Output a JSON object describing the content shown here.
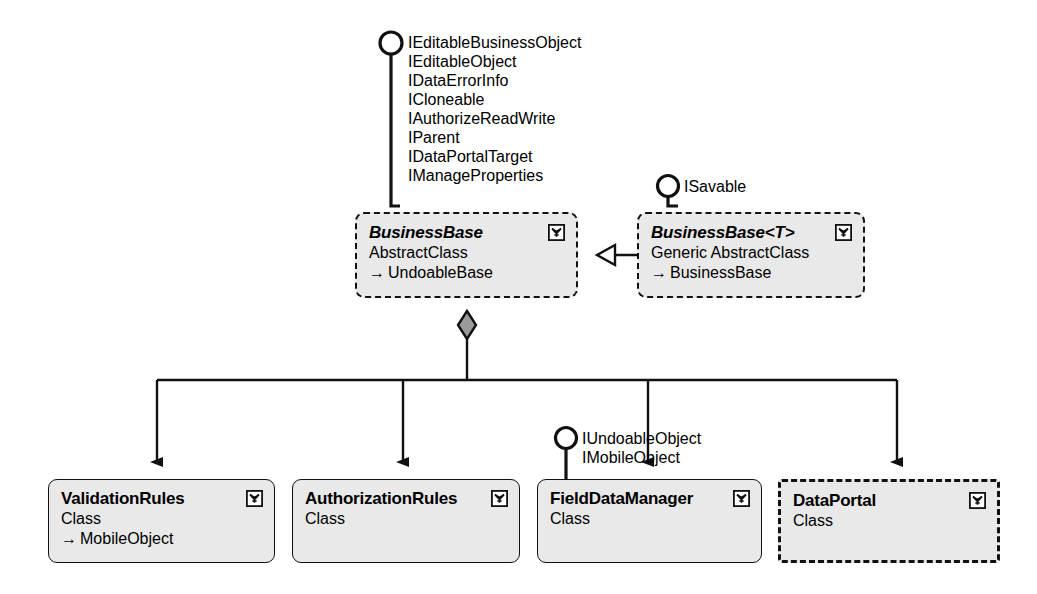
{
  "diagram": {
    "colors": {
      "node_fill": "#e9e9e9",
      "stroke": "#111111",
      "diamond_fill": "#9a9a9a",
      "background": "#ffffff"
    },
    "icon_name": "class-collapse-chevron-icon",
    "inherits_glyph": "→"
  },
  "interfaces": {
    "business_base": {
      "name": "business-base-interfaces",
      "labels": [
        "IEditableBusinessObject",
        "IEditableObject",
        "IDataErrorInfo",
        "ICloneable",
        "IAuthorizeReadWrite",
        "IParent",
        "IDataPortalTarget",
        "IManageProperties"
      ]
    },
    "business_base_generic": {
      "name": "business-base-generic-interfaces",
      "labels": [
        "ISavable"
      ]
    },
    "field_data_manager": {
      "name": "field-data-manager-interfaces",
      "labels": [
        "IUndoableObject",
        "IMobileObject"
      ]
    }
  },
  "nodes": {
    "business_base": {
      "title": "BusinessBase",
      "stereotype": "AbstractClass",
      "base": "UndoableBase",
      "border": "dashed",
      "title_style": "italic"
    },
    "business_base_generic": {
      "title": "BusinessBase<T>",
      "stereotype": "Generic AbstractClass",
      "base": "BusinessBase",
      "border": "dashed",
      "title_style": "italic"
    },
    "validation_rules": {
      "title": "ValidationRules",
      "stereotype": "Class",
      "base": "MobileObject",
      "border": "solid",
      "title_style": "normal"
    },
    "authorization_rules": {
      "title": "AuthorizationRules",
      "stereotype": "Class",
      "base": "",
      "border": "solid",
      "title_style": "normal"
    },
    "field_data_manager": {
      "title": "FieldDataManager",
      "stereotype": "Class",
      "base": "",
      "border": "solid",
      "title_style": "normal"
    },
    "data_portal": {
      "title": "DataPortal",
      "stereotype": "Class",
      "base": "",
      "border": "dashed-bold",
      "title_style": "normal"
    }
  },
  "relations": {
    "generalization": {
      "name": "generalization-business-base",
      "from": "BusinessBase<T>",
      "to": "BusinessBase",
      "kind": "inheritance"
    },
    "aggregation": {
      "name": "aggregation-business-base",
      "from": "BusinessBase",
      "kind": "aggregation",
      "targets": [
        "ValidationRules",
        "AuthorizationRules",
        "FieldDataManager",
        "DataPortal"
      ]
    }
  }
}
